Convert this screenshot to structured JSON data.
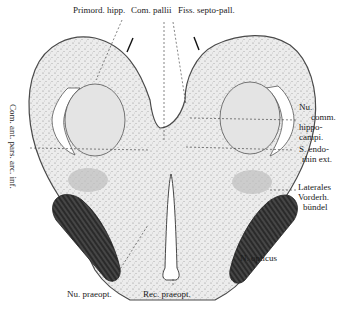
{
  "figure": {
    "colors": {
      "background": "#ffffff",
      "tissue": "#e9e9e9",
      "tissue_outline": "#4a4a4a",
      "optic_nerve": "#2c2c2c",
      "ventricle": "#ffffff",
      "text": "#1a1a1a"
    }
  },
  "labels": {
    "top": {
      "primord_hipp": "Primord. hipp.",
      "com_pallii": "Com. pallii",
      "fiss_septo_pall": "Fiss. septo-pall."
    },
    "left_vertical": "Com. ant. pars. arc. inf.",
    "right": {
      "nu_comm_hippo_campi": [
        "Nu.",
        "comm.",
        "hippo-",
        "campi."
      ],
      "s_endorhin_ext": [
        "S. endo-",
        "rhin ext."
      ],
      "laterales_vorderh_bundel": [
        "Laterales",
        "Vorderh.",
        "bündel"
      ],
      "n_opticus": "N. opticus"
    },
    "bottom": {
      "nu_praeopt": "Nu. praeopt.",
      "rec_praeopt": "Rec. praeopt."
    }
  }
}
